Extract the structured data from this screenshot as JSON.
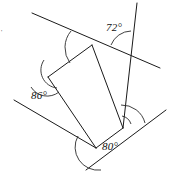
{
  "figure": {
    "shape": "quadrilateral",
    "background_color": "#ffffff",
    "line_color": "#1a1a1a",
    "label_color": "#111111"
  },
  "labels": {
    "angle_top_right": "72°",
    "angle_left": "86°",
    "angle_bottom": "80°",
    "stray_tick": "'"
  },
  "angles": [
    {
      "id": "top-left",
      "label": "",
      "measure": null,
      "labeled": false,
      "vertex": [
        92,
        45
      ]
    },
    {
      "id": "top-right",
      "label": "72°",
      "measure": 72,
      "labeled": true,
      "vertex": [
        133,
        53
      ]
    },
    {
      "id": "left",
      "label": "86°",
      "measure": 86,
      "labeled": true,
      "vertex": [
        48,
        77
      ]
    },
    {
      "id": "bottom-right",
      "label": "",
      "measure": null,
      "labeled": false,
      "vertex": [
        123,
        128
      ]
    },
    {
      "id": "bottom",
      "label": "80°",
      "measure": 80,
      "labeled": true,
      "vertex": [
        96,
        148
      ]
    }
  ],
  "vertices": {
    "top": [
      92,
      45
    ],
    "left": [
      48,
      77
    ],
    "bottom": [
      96,
      148
    ],
    "right": [
      123,
      128
    ]
  },
  "lines": [
    {
      "id": "top-transversal",
      "from": [
        32,
        13
      ],
      "to": [
        160,
        68
      ],
      "description": "line through top vertex extended past top-right intersection"
    },
    {
      "id": "right-vertical",
      "from": [
        137,
        3
      ],
      "to": [
        123,
        128
      ],
      "description": "near-vertical line through top-right and bottom-right vertices"
    },
    {
      "id": "left-side",
      "from": [
        14,
        100
      ],
      "to": [
        96,
        148
      ],
      "description": "line through left vertex extended down-left"
    },
    {
      "id": "bottom-transversal",
      "from": [
        86,
        170
      ],
      "to": [
        166,
        110
      ],
      "description": "line through bottom and bottom-right vertices"
    },
    {
      "id": "side-top-left",
      "from": [
        92,
        45
      ],
      "to": [
        48,
        77
      ],
      "description": "quadrilateral side"
    },
    {
      "id": "side-left-bottom",
      "from": [
        48,
        77
      ],
      "to": [
        96,
        148
      ],
      "description": "quadrilateral side"
    },
    {
      "id": "side-bottom-right",
      "from": [
        96,
        148
      ],
      "to": [
        123,
        128
      ],
      "description": "quadrilateral side"
    },
    {
      "id": "side-right-top",
      "from": [
        123,
        128
      ],
      "to": [
        92,
        45
      ],
      "description": "quadrilateral side"
    }
  ]
}
